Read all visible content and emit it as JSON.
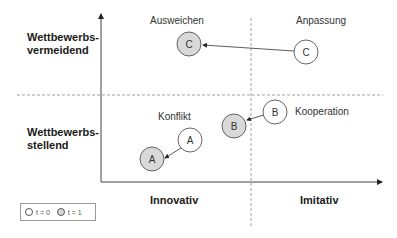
{
  "y_axis": {
    "top_label": "Wettbewerbs-\nvermeidend",
    "top_label_line1": "Wettbewerbs-",
    "top_label_line2": "vermeidend",
    "bottom_label_line1": "Wettbewerbs-",
    "bottom_label_line2": "stellend"
  },
  "x_axis": {
    "left_label": "Innovativ",
    "right_label": "Imitativ"
  },
  "quadrants": {
    "top_left": "Ausweichen",
    "top_right": "Anpassung",
    "bottom_left": "Konflikt",
    "bottom_right": "Kooperation"
  },
  "nodes": [
    {
      "id": "C",
      "time": 0,
      "label": "C",
      "x": 306,
      "y": 52
    },
    {
      "id": "C",
      "time": 1,
      "label": "C",
      "x": 189,
      "y": 44
    },
    {
      "id": "B",
      "time": 0,
      "label": "B",
      "x": 275,
      "y": 112
    },
    {
      "id": "B",
      "time": 1,
      "label": "B",
      "x": 234,
      "y": 126
    },
    {
      "id": "A",
      "time": 0,
      "label": "A",
      "x": 190,
      "y": 140
    },
    {
      "id": "A",
      "time": 1,
      "label": "A",
      "x": 152,
      "y": 159
    }
  ],
  "legend": {
    "t0_label": "t = 0",
    "t1_label": "t = 1"
  },
  "colors": {
    "t0_fill": "#ffffff",
    "t1_fill": "#d9d9d9",
    "stroke": "#555555"
  }
}
